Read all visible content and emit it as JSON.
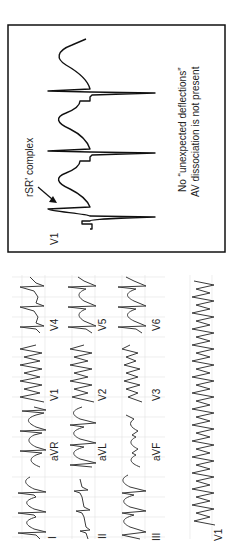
{
  "figure": {
    "orientation": "rotated-90-ccw",
    "twelve_lead": {
      "rows": [
        [
          "I",
          "aVR",
          "V1",
          "V4"
        ],
        [
          "II",
          "aVL",
          "V2",
          "V5"
        ],
        [
          "III",
          "aVF",
          "V3",
          "V6"
        ]
      ],
      "rhythm_strip_label": "V1"
    },
    "inset": {
      "lead_label": "V1",
      "annotation": "rSR' complex",
      "note_line1": "No “unexpected deflections”",
      "note_line2": "AV dissociation is not present"
    },
    "colors": {
      "trace": "#3a3a3a",
      "grid": "#e3e3e3",
      "box_border": "#111111"
    }
  }
}
